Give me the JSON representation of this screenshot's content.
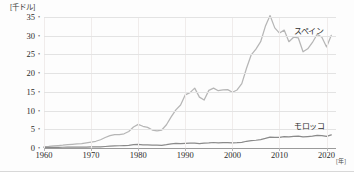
{
  "chart_data": {
    "type": "line",
    "title": "",
    "xlabel": "年",
    "ylabel": "千ドル",
    "y_unit_label": "[千ドル]",
    "x_unit_label": "[年]",
    "xlim": [
      1960,
      2022
    ],
    "ylim": [
      0,
      35
    ],
    "yticks": [
      0,
      5,
      10,
      15,
      20,
      25,
      30,
      35
    ],
    "ytick_labels": [
      "0",
      "5",
      "10",
      "15",
      "20",
      "25",
      "30",
      "35"
    ],
    "xticks": [
      1960,
      1970,
      1980,
      1990,
      2000,
      2010,
      2020
    ],
    "xtick_labels": [
      "1960",
      "1970",
      "1980",
      "1990",
      "2000",
      "2010",
      "2020"
    ],
    "grid": true,
    "legend_position": "inline-right",
    "series": [
      {
        "name": "スペイン",
        "color": "#b6b6b6",
        "label_x": 2013,
        "label_y": 31.5,
        "x": [
          1960,
          1961,
          1962,
          1963,
          1964,
          1965,
          1966,
          1967,
          1968,
          1969,
          1970,
          1971,
          1972,
          1973,
          1974,
          1975,
          1976,
          1977,
          1978,
          1979,
          1980,
          1981,
          1982,
          1983,
          1984,
          1985,
          1986,
          1987,
          1988,
          1989,
          1990,
          1991,
          1992,
          1993,
          1994,
          1995,
          1996,
          1997,
          1998,
          1999,
          2000,
          2001,
          2002,
          2003,
          2004,
          2005,
          2006,
          2007,
          2008,
          2009,
          2010,
          2011,
          2012,
          2013,
          2014,
          2015,
          2016,
          2017,
          2018,
          2019,
          2020,
          2021
        ],
        "values": [
          0.4,
          0.45,
          0.55,
          0.65,
          0.75,
          0.9,
          1.0,
          1.1,
          1.2,
          1.4,
          1.6,
          1.8,
          2.2,
          2.8,
          3.3,
          3.6,
          3.6,
          3.8,
          4.4,
          5.6,
          6.3,
          5.8,
          5.5,
          4.8,
          4.6,
          4.8,
          6.2,
          8.3,
          10.2,
          11.5,
          14.2,
          14.8,
          16.0,
          13.6,
          12.8,
          15.4,
          16.0,
          15.3,
          15.5,
          15.6,
          14.9,
          15.5,
          17.2,
          21.3,
          24.9,
          26.4,
          28.4,
          32.5,
          35.4,
          32.1,
          30.7,
          31.5,
          28.4,
          29.6,
          29.4,
          25.7,
          26.5,
          28.2,
          30.4,
          29.6,
          27.0,
          30.1
        ]
      },
      {
        "name": "モロッコ",
        "color": "#8a8a8a",
        "label_x": 2013,
        "label_y": 6.2,
        "x": [
          1960,
          1961,
          1962,
          1963,
          1964,
          1965,
          1966,
          1967,
          1968,
          1969,
          1970,
          1971,
          1972,
          1973,
          1974,
          1975,
          1976,
          1977,
          1978,
          1979,
          1980,
          1981,
          1982,
          1983,
          1984,
          1985,
          1986,
          1987,
          1988,
          1989,
          1990,
          1991,
          1992,
          1993,
          1994,
          1995,
          1996,
          1997,
          1998,
          1999,
          2000,
          2001,
          2002,
          2003,
          2004,
          2005,
          2006,
          2007,
          2008,
          2009,
          2010,
          2011,
          2012,
          2013,
          2014,
          2015,
          2016,
          2017,
          2018,
          2019,
          2020,
          2021
        ],
        "values": [
          0.16,
          0.17,
          0.17,
          0.19,
          0.2,
          0.21,
          0.21,
          0.22,
          0.24,
          0.26,
          0.27,
          0.29,
          0.33,
          0.4,
          0.49,
          0.58,
          0.6,
          0.66,
          0.73,
          0.87,
          1.0,
          0.85,
          0.86,
          0.8,
          0.75,
          0.73,
          0.88,
          1.08,
          1.22,
          1.16,
          1.26,
          1.3,
          1.28,
          1.18,
          1.28,
          1.34,
          1.47,
          1.38,
          1.45,
          1.45,
          1.38,
          1.41,
          1.53,
          1.8,
          2.0,
          2.07,
          2.25,
          2.55,
          2.9,
          2.85,
          2.85,
          3.05,
          2.95,
          3.1,
          3.15,
          2.95,
          3.05,
          3.15,
          3.35,
          3.3,
          3.1,
          3.5
        ]
      }
    ]
  }
}
